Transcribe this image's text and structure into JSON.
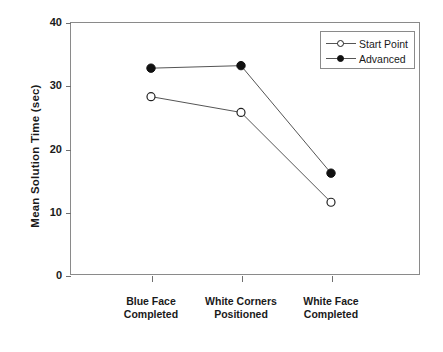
{
  "chart_data": {
    "type": "line",
    "title": "",
    "subtitle": "",
    "xlabel": "",
    "ylabel": "Mean Solution Time (sec)",
    "categories": [
      "Blue Face\nCompleted",
      "White Corners\nPositioned",
      "White Face\nCompleted"
    ],
    "categories_lines": [
      [
        "Blue Face",
        "Completed"
      ],
      [
        "White Corners",
        "Positioned"
      ],
      [
        "White Face",
        "Completed"
      ]
    ],
    "series": [
      {
        "name": "Start Point",
        "marker": "open-circle",
        "color": "#222222",
        "values": [
          28.2,
          25.7,
          11.5
        ]
      },
      {
        "name": "Advanced",
        "marker": "filled-circle",
        "color": "#111111",
        "values": [
          32.7,
          33.1,
          16.1
        ]
      }
    ],
    "ylim": [
      0,
      40
    ],
    "yticks": [
      0,
      10,
      20,
      30,
      40
    ],
    "ytick_labels": [
      "0",
      "10",
      "20",
      "30",
      "40"
    ],
    "grid": false,
    "legend_position": "top-right",
    "legend_entries": [
      "Start Point",
      "Advanced"
    ]
  },
  "axes": {
    "y_title": "Mean Solution Time (sec)"
  },
  "legend": {
    "items": [
      {
        "label": "Start Point",
        "marker": "open-circle"
      },
      {
        "label": "Advanced",
        "marker": "filled-circle"
      }
    ]
  }
}
